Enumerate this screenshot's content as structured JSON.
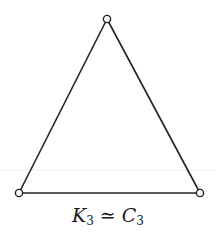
{
  "diagram": {
    "type": "graph",
    "vertices": [
      {
        "id": "v1",
        "x": 107,
        "y": 19
      },
      {
        "id": "v2",
        "x": 19,
        "y": 193
      },
      {
        "id": "v3",
        "x": 200,
        "y": 193
      }
    ],
    "edges": [
      [
        "v1",
        "v2"
      ],
      [
        "v2",
        "v3"
      ],
      [
        "v3",
        "v1"
      ]
    ],
    "colors": {
      "stroke": "#222222",
      "fill": "#ffffff",
      "artifact_line": "#ececec"
    }
  },
  "caption": {
    "left_symbol": "K",
    "left_sub": "3",
    "relation": "≃",
    "right_symbol": "C",
    "right_sub": "3"
  }
}
